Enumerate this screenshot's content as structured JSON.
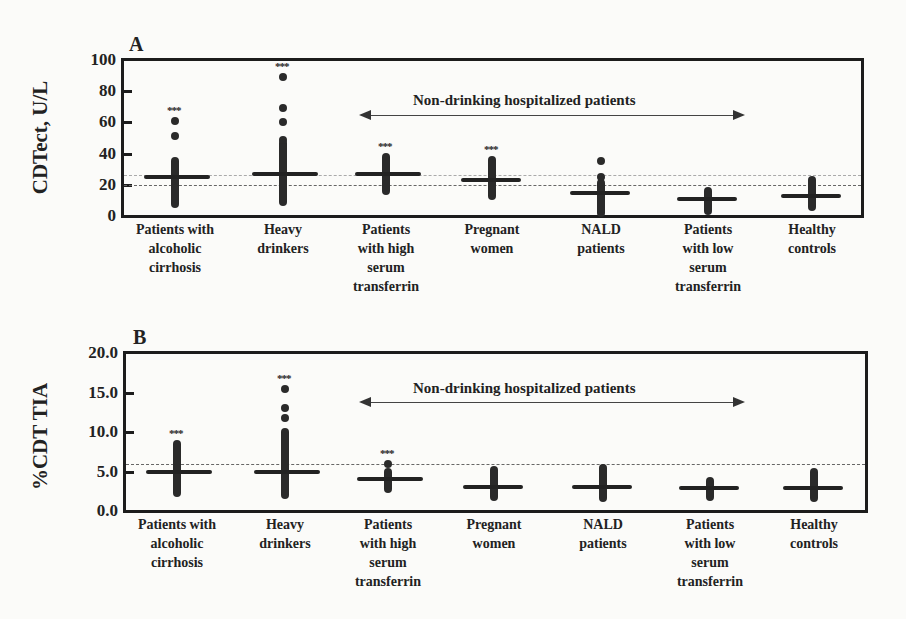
{
  "chart_data": [
    {
      "type": "scatter",
      "panel": "A",
      "title": "A",
      "xlabel": "",
      "ylabel": "CDTect, U/L",
      "ylim": [
        0,
        100
      ],
      "yticks": [
        "0",
        "20",
        "40",
        "60",
        "80",
        "100"
      ],
      "grid": false,
      "reference_lines": [
        {
          "value": 26,
          "style": "dotted"
        },
        {
          "value": 20,
          "style": "dashed"
        }
      ],
      "annotation": "Non-drinking hospitalized patients",
      "categories": [
        "Patients with\nalcoholic\ncirrhosis",
        "Heavy\ndrinkers",
        "Patients\nwith high\nserum\ntransferrin",
        "Pregnant\nwomen",
        "NALD\npatients",
        "Patients\nwith low\nserum\ntransferrin",
        "Healthy\ncontrols"
      ],
      "significance": [
        "***",
        "***",
        "***",
        "***",
        "",
        "",
        ""
      ],
      "medians": [
        25,
        27,
        27,
        23,
        15,
        11,
        13
      ],
      "ranges": [
        [
          8,
          35
        ],
        [
          9,
          47
        ],
        [
          16,
          38
        ],
        [
          13,
          36
        ],
        [
          2,
          21
        ],
        [
          3,
          16
        ],
        [
          6,
          23
        ]
      ],
      "outliers": [
        [
          61,
          51
        ],
        [
          89,
          69,
          60,
          49
        ],
        [],
        [],
        [
          35,
          25
        ],
        [],
        []
      ]
    },
    {
      "type": "scatter",
      "panel": "B",
      "title": "B",
      "xlabel": "",
      "ylabel": "%CDT TIA",
      "ylim": [
        0,
        20
      ],
      "yticks": [
        "0.0",
        "5.0",
        "10.0",
        "15.0",
        "20.0"
      ],
      "grid": false,
      "reference_lines": [
        {
          "value": 6.0,
          "style": "dashed"
        }
      ],
      "annotation": "Non-drinking hospitalized patients",
      "categories": [
        "Patients with\nalcoholic\ncirrhosis",
        "Heavy\ndrinkers",
        "Patients\nwith high\nserum\ntransferrin",
        "Pregnant\nwomen",
        "NALD\npatients",
        "Patients\nwith low\nserum\ntransferrin",
        "Healthy\ncontrols"
      ],
      "significance": [
        "***",
        "***",
        "***",
        "",
        "",
        "",
        ""
      ],
      "medians": [
        5.0,
        5.0,
        4.0,
        3.1,
        3.0,
        2.9,
        2.9
      ],
      "ranges": [
        [
          2.3,
          8.5
        ],
        [
          2.0,
          10.0
        ],
        [
          2.8,
          5.0
        ],
        [
          1.8,
          5.2
        ],
        [
          1.6,
          5.5
        ],
        [
          1.8,
          3.8
        ],
        [
          1.6,
          4.9
        ]
      ],
      "outliers": [
        [],
        [
          15.5,
          13.0,
          11.8
        ],
        [
          5.9
        ],
        [],
        [],
        [],
        []
      ]
    }
  ]
}
